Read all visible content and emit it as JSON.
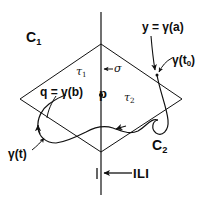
{
  "figure": {
    "type": "mathematical-diagram",
    "stroke_color": "#111111",
    "background_color": "#ffffff"
  },
  "labels": {
    "region_upper": "C",
    "region_upper_sub": "1",
    "region_lower": "C",
    "region_lower_sub": "2",
    "tau_1": "τ",
    "tau_1_sub": "1",
    "tau_2": "τ",
    "tau_2_sub": "2",
    "sigma": "σ",
    "point_p": "p",
    "point_q": "q = γ(b)",
    "point_y": "y = γ(a)",
    "gamma_t0": "γ(t",
    "gamma_t0_sub": "0",
    "gamma_t0_close": ")",
    "gamma_t": "γ(t)",
    "line_L": "ILI"
  },
  "geometry": {
    "parallelogram_vertices": [
      {
        "x": 101,
        "y": 44
      },
      {
        "x": 182,
        "y": 99
      },
      {
        "x": 101,
        "y": 152
      },
      {
        "x": 20,
        "y": 99
      }
    ],
    "vertical_line": {
      "x": 101,
      "y_top": 12,
      "y_bottom": 195
    },
    "point_p": {
      "x": 101,
      "y": 95
    },
    "point_t0": {
      "x": 157,
      "y": 75
    }
  }
}
